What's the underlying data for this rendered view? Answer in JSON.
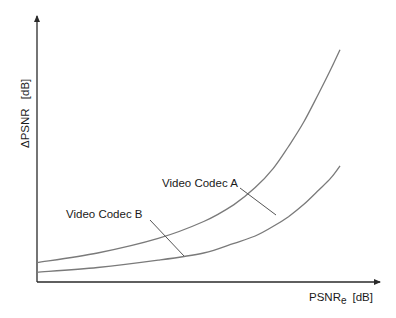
{
  "chart_data": {
    "type": "line",
    "title": "",
    "xlabel": "PSNR",
    "xlabel_subscript": "e",
    "xlabel_unit": "[dB]",
    "ylabel": "ΔPSNR",
    "ylabel_unit": "[dB]",
    "xlim": [
      0,
      1
    ],
    "ylim": [
      0,
      1
    ],
    "grid": false,
    "ticks": false,
    "series": [
      {
        "name": "Video Codec A",
        "x": [
          0.0,
          0.2,
          0.4,
          0.55,
          0.65,
          0.72,
          0.78,
          0.83,
          0.88,
          0.93,
          0.97,
          1.0
        ],
        "y": [
          0.08,
          0.12,
          0.18,
          0.25,
          0.32,
          0.39,
          0.47,
          0.56,
          0.66,
          0.78,
          0.88,
          0.96
        ]
      },
      {
        "name": "Video Codec B",
        "x": [
          0.0,
          0.2,
          0.4,
          0.55,
          0.65,
          0.72,
          0.78,
          0.83,
          0.88,
          0.93,
          0.97,
          1.0
        ],
        "y": [
          0.04,
          0.06,
          0.09,
          0.12,
          0.16,
          0.19,
          0.23,
          0.27,
          0.32,
          0.38,
          0.43,
          0.48
        ]
      }
    ],
    "annotations": [
      "Video Codec A",
      "Video Codec B"
    ],
    "legend": "none (inline labels with leader lines)"
  }
}
